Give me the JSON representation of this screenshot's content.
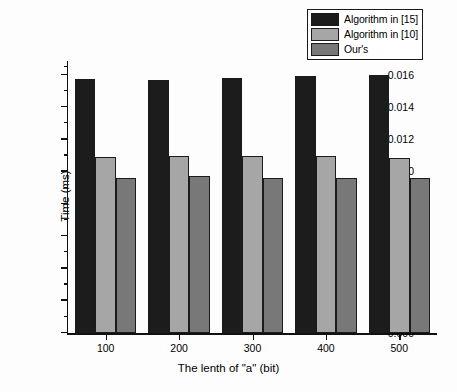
{
  "chart_data": {
    "type": "bar",
    "title": "",
    "xlabel": "The lenth of \"a\" (bit)",
    "ylabel": "Time (ms)",
    "categories": [
      "100",
      "200",
      "300",
      "400",
      "500"
    ],
    "series": [
      {
        "name": "Algorithm in [15]",
        "color": "#1c1c1c",
        "values": [
          0.01578,
          0.01572,
          0.0158,
          0.01592,
          0.016
        ]
      },
      {
        "name": "Algorithm in [10]",
        "color": "#a6a6a6",
        "values": [
          0.01092,
          0.011,
          0.01098,
          0.01096,
          0.01084
        ]
      },
      {
        "name": "Our's",
        "color": "#787878",
        "values": [
          0.00961,
          0.00972,
          0.0096,
          0.0096,
          0.0096
        ]
      }
    ],
    "ylim": [
      0.0,
      0.016
    ],
    "y_axis_top_value": 0.0162,
    "ytick_labels": [
      "0.000",
      "0.002",
      "0.004",
      "0.006",
      "0.008",
      "0.010",
      "0.012",
      "0.014",
      "0.016"
    ],
    "ytick_values": [
      0.0,
      0.002,
      0.004,
      0.006,
      0.008,
      0.01,
      0.012,
      0.014,
      0.016
    ],
    "yminor_step": 0.001,
    "grid": false,
    "legend_position": "top-right",
    "bar_outline_color": "#1b1b1b"
  },
  "legend": {
    "items": [
      {
        "label": "Algorithm in [15]"
      },
      {
        "label": "Algorithm in [10]"
      },
      {
        "label": "Our's"
      }
    ]
  }
}
